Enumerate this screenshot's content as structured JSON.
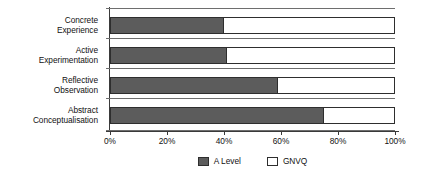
{
  "chart_data": {
    "type": "bar",
    "orientation": "horizontal",
    "stacked": true,
    "title": "",
    "subtitle": "",
    "xlabel": "",
    "ylabel": "",
    "xlim": [
      0,
      100
    ],
    "grid": false,
    "legend_position": "bottom-center",
    "categories": [
      "Concrete Experience",
      "Active Experimentation",
      "Reflective Observation",
      "Abstract Conceptualisation"
    ],
    "category_lines": [
      [
        "Concrete",
        "Experience"
      ],
      [
        "Active",
        "Experimentation"
      ],
      [
        "Reflective",
        "Observation"
      ],
      [
        "Abstract",
        "Conceptualisation"
      ]
    ],
    "series": [
      {
        "name": "A Level",
        "color": "#5c5c5c",
        "values": [
          40,
          41,
          59,
          75
        ]
      },
      {
        "name": "GNVQ",
        "color": "#ffffff",
        "values": [
          60,
          59,
          41,
          25
        ]
      }
    ],
    "xticks": [
      0,
      20,
      40,
      60,
      80,
      100
    ],
    "xtick_labels": [
      "0%",
      "20%",
      "40%",
      "60%",
      "80%",
      "100%"
    ]
  },
  "legend": {
    "items": [
      {
        "label": "A Level",
        "swatch": "filled"
      },
      {
        "label": "GNVQ",
        "swatch": "empty"
      }
    ]
  },
  "colors": {
    "a_level": "#5c5c5c",
    "gnvq": "#ffffff",
    "axis": "#3a3a3a",
    "outline": "#2e2e2e",
    "separator": "#6e6e6e",
    "text": "#111111",
    "background": "#ffffff"
  }
}
